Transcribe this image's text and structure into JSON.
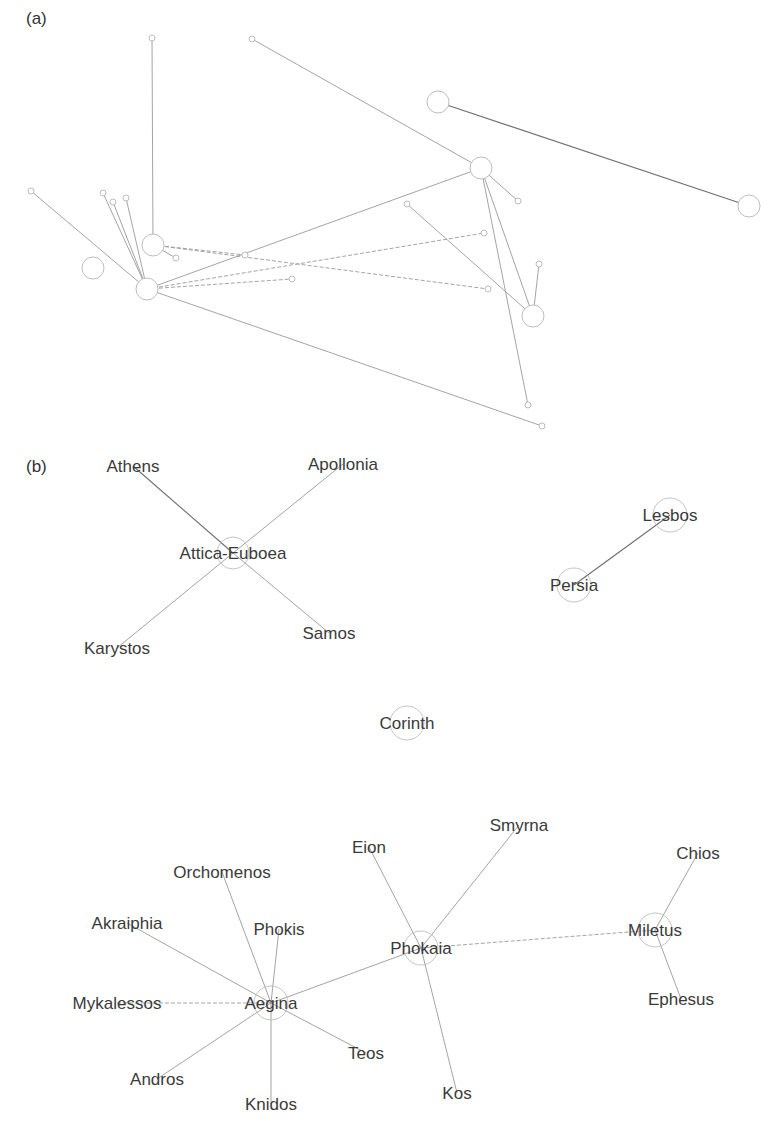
{
  "panel_a": {
    "label": "(a)",
    "label_pos": [
      26,
      24
    ],
    "nodes": [
      {
        "id": "a1",
        "x": 152,
        "y": 38,
        "r": 3
      },
      {
        "id": "a2",
        "x": 252,
        "y": 39,
        "r": 3
      },
      {
        "id": "a3",
        "x": 438,
        "y": 102,
        "r": 11
      },
      {
        "id": "a4",
        "x": 749,
        "y": 206,
        "r": 11
      },
      {
        "id": "a5",
        "x": 481,
        "y": 168,
        "r": 11
      },
      {
        "id": "a6",
        "x": 533,
        "y": 316,
        "r": 11
      },
      {
        "id": "a7",
        "x": 153,
        "y": 245,
        "r": 11
      },
      {
        "id": "a8",
        "x": 93,
        "y": 268,
        "r": 11
      },
      {
        "id": "a9",
        "x": 147,
        "y": 289,
        "r": 11
      },
      {
        "id": "a10",
        "x": 31,
        "y": 191,
        "r": 3
      },
      {
        "id": "a11",
        "x": 103,
        "y": 193,
        "r": 3
      },
      {
        "id": "a12",
        "x": 113,
        "y": 202,
        "r": 3
      },
      {
        "id": "a13",
        "x": 126,
        "y": 198,
        "r": 3
      },
      {
        "id": "a14",
        "x": 176,
        "y": 258,
        "r": 3
      },
      {
        "id": "a15",
        "x": 245,
        "y": 255,
        "r": 3
      },
      {
        "id": "a16",
        "x": 292,
        "y": 279,
        "r": 3
      },
      {
        "id": "a17",
        "x": 407,
        "y": 204,
        "r": 3
      },
      {
        "id": "a18",
        "x": 484,
        "y": 233,
        "r": 3
      },
      {
        "id": "a19",
        "x": 488,
        "y": 289,
        "r": 3
      },
      {
        "id": "a20",
        "x": 518,
        "y": 201,
        "r": 3
      },
      {
        "id": "a21",
        "x": 539,
        "y": 264,
        "r": 3
      },
      {
        "id": "a22",
        "x": 528,
        "y": 405,
        "r": 3
      },
      {
        "id": "a23",
        "x": 542,
        "y": 426,
        "r": 3
      }
    ],
    "edges": [
      {
        "from": "a1",
        "to": "a7",
        "style": "solid"
      },
      {
        "from": "a2",
        "to": "a5",
        "style": "solid"
      },
      {
        "from": "a3",
        "to": "a4",
        "style": "dark"
      },
      {
        "from": "a10",
        "to": "a9",
        "style": "solid"
      },
      {
        "from": "a11",
        "to": "a9",
        "style": "solid"
      },
      {
        "from": "a12",
        "to": "a9",
        "style": "solid"
      },
      {
        "from": "a13",
        "to": "a9",
        "style": "solid"
      },
      {
        "from": "a7",
        "to": "a14",
        "style": "solid"
      },
      {
        "from": "a7",
        "to": "a15",
        "style": "dashed"
      },
      {
        "from": "a7",
        "to": "a19",
        "style": "dashed"
      },
      {
        "from": "a9",
        "to": "a5",
        "style": "solid"
      },
      {
        "from": "a9",
        "to": "a18",
        "style": "dashed"
      },
      {
        "from": "a9",
        "to": "a16",
        "style": "dashed"
      },
      {
        "from": "a9",
        "to": "a23",
        "style": "solid"
      },
      {
        "from": "a5",
        "to": "a20",
        "style": "solid"
      },
      {
        "from": "a5",
        "to": "a6",
        "style": "solid"
      },
      {
        "from": "a5",
        "to": "a22",
        "style": "solid"
      },
      {
        "from": "a17",
        "to": "a6",
        "style": "solid"
      },
      {
        "from": "a21",
        "to": "a6",
        "style": "solid"
      }
    ]
  },
  "panel_b": {
    "label": "(b)",
    "label_pos": [
      26,
      472
    ],
    "nodes": [
      {
        "id": "attica",
        "label": "Attica-Euboea",
        "x": 233,
        "y": 553,
        "r": 16,
        "circle": true
      },
      {
        "id": "athens",
        "label": "Athens",
        "x": 133,
        "y": 466,
        "r": 0,
        "circle": false
      },
      {
        "id": "apollonia",
        "label": "Apollonia",
        "x": 343,
        "y": 464,
        "r": 0,
        "circle": false
      },
      {
        "id": "karystos",
        "label": "Karystos",
        "x": 117,
        "y": 648,
        "r": 0,
        "circle": false
      },
      {
        "id": "samos",
        "label": "Samos",
        "x": 329,
        "y": 633,
        "r": 0,
        "circle": false
      },
      {
        "id": "lesbos",
        "label": "Lesbos",
        "x": 670,
        "y": 515,
        "r": 17,
        "circle": true
      },
      {
        "id": "persia",
        "label": "Persia",
        "x": 574,
        "y": 585,
        "r": 17,
        "circle": true
      },
      {
        "id": "corinth",
        "label": "Corinth",
        "x": 407,
        "y": 723,
        "r": 17,
        "circle": true
      },
      {
        "id": "aegina",
        "label": "Aegina",
        "x": 271,
        "y": 1003,
        "r": 17,
        "circle": true
      },
      {
        "id": "orchomenos",
        "label": "Orchomenos",
        "x": 222,
        "y": 872,
        "r": 0,
        "circle": false
      },
      {
        "id": "akraiphia",
        "label": "Akraiphia",
        "x": 127,
        "y": 923,
        "r": 0,
        "circle": false
      },
      {
        "id": "phokis",
        "label": "Phokis",
        "x": 279,
        "y": 929,
        "r": 0,
        "circle": false
      },
      {
        "id": "mykalessos",
        "label": "Mykalessos",
        "x": 117,
        "y": 1003,
        "r": 0,
        "circle": false
      },
      {
        "id": "andros",
        "label": "Andros",
        "x": 157,
        "y": 1079,
        "r": 0,
        "circle": false
      },
      {
        "id": "knidos",
        "label": "Knidos",
        "x": 271,
        "y": 1104,
        "r": 0,
        "circle": false
      },
      {
        "id": "teos",
        "label": "Teos",
        "x": 366,
        "y": 1053,
        "r": 0,
        "circle": false
      },
      {
        "id": "phokaia",
        "label": "Phokaia",
        "x": 421,
        "y": 948,
        "r": 17,
        "circle": true
      },
      {
        "id": "eion",
        "label": "Eion",
        "x": 369,
        "y": 847,
        "r": 0,
        "circle": false
      },
      {
        "id": "smyrna",
        "label": "Smyrna",
        "x": 519,
        "y": 825,
        "r": 0,
        "circle": false
      },
      {
        "id": "kos",
        "label": "Kos",
        "x": 457,
        "y": 1093,
        "r": 0,
        "circle": false
      },
      {
        "id": "miletus",
        "label": "Miletus",
        "x": 655,
        "y": 930,
        "r": 17,
        "circle": true
      },
      {
        "id": "chios",
        "label": "Chios",
        "x": 698,
        "y": 853,
        "r": 0,
        "circle": false
      },
      {
        "id": "ephesus",
        "label": "Ephesus",
        "x": 681,
        "y": 999,
        "r": 0,
        "circle": false
      }
    ],
    "edges": [
      {
        "from": "athens",
        "to": "attica",
        "style": "dark"
      },
      {
        "from": "apollonia",
        "to": "attica",
        "style": "solid"
      },
      {
        "from": "karystos",
        "to": "attica",
        "style": "solid"
      },
      {
        "from": "samos",
        "to": "attica",
        "style": "solid"
      },
      {
        "from": "lesbos",
        "to": "persia",
        "style": "dark"
      },
      {
        "from": "orchomenos",
        "to": "aegina",
        "style": "solid"
      },
      {
        "from": "akraiphia",
        "to": "aegina",
        "style": "solid"
      },
      {
        "from": "phokis",
        "to": "aegina",
        "style": "solid"
      },
      {
        "from": "mykalessos",
        "to": "aegina",
        "style": "dashed"
      },
      {
        "from": "andros",
        "to": "aegina",
        "style": "solid"
      },
      {
        "from": "knidos",
        "to": "aegina",
        "style": "solid"
      },
      {
        "from": "teos",
        "to": "aegina",
        "style": "solid"
      },
      {
        "from": "aegina",
        "to": "phokaia",
        "style": "solid"
      },
      {
        "from": "eion",
        "to": "phokaia",
        "style": "solid"
      },
      {
        "from": "smyrna",
        "to": "phokaia",
        "style": "solid"
      },
      {
        "from": "kos",
        "to": "phokaia",
        "style": "solid"
      },
      {
        "from": "phokaia",
        "to": "miletus",
        "style": "dashed"
      },
      {
        "from": "chios",
        "to": "miletus",
        "style": "solid"
      },
      {
        "from": "ephesus",
        "to": "miletus",
        "style": "solid"
      }
    ]
  }
}
